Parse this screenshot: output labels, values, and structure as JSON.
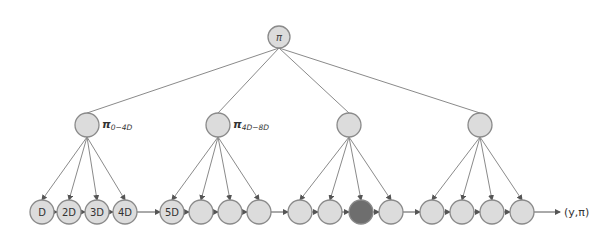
{
  "colors": {
    "node_fill": "#dcdcdc",
    "node_stroke": "#8a8a8a",
    "highlight_fill": "#6e6e6e",
    "edge": "#8a8a8a",
    "text": "#333333"
  },
  "root": {
    "label": "π",
    "x": 279,
    "y": 37,
    "r": 11
  },
  "mid_nodes": [
    {
      "label": "π0−4D",
      "main": "π",
      "sub": "0−4D",
      "x": 87,
      "y": 125
    },
    {
      "label": "π4D−8D",
      "main": "π",
      "sub": "4D−8D",
      "x": 218,
      "y": 125
    },
    {
      "label": "",
      "main": "",
      "sub": "",
      "x": 349,
      "y": 125
    },
    {
      "label": "",
      "main": "",
      "sub": "",
      "x": 480,
      "y": 125
    }
  ],
  "leaf_groups": [
    [
      {
        "label": "D",
        "x": 42
      },
      {
        "label": "2D",
        "x": 69
      },
      {
        "label": "3D",
        "x": 97
      },
      {
        "label": "4D",
        "x": 125
      }
    ],
    [
      {
        "label": "5D",
        "x": 172
      },
      {
        "label": "",
        "x": 201
      },
      {
        "label": "",
        "x": 230
      },
      {
        "label": "",
        "x": 259
      }
    ],
    [
      {
        "label": "",
        "x": 300
      },
      {
        "label": "",
        "x": 330
      },
      {
        "label": "",
        "x": 361,
        "highlight": true
      },
      {
        "label": "",
        "x": 391
      }
    ],
    [
      {
        "label": "",
        "x": 432
      },
      {
        "label": "",
        "x": 462
      },
      {
        "label": "",
        "x": 492
      },
      {
        "label": "",
        "x": 522
      }
    ]
  ],
  "leaf_y": 212,
  "node_r": 12,
  "output_label": "(y,π)"
}
